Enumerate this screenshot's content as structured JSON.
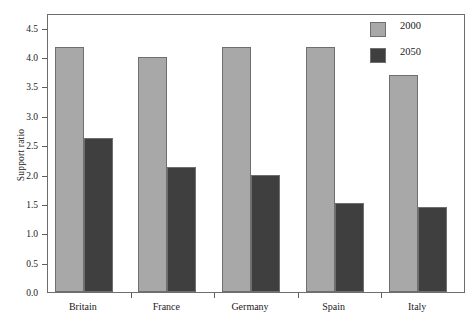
{
  "chart_data": {
    "type": "bar",
    "title": "",
    "subtitle": "",
    "xlabel": "",
    "ylabel": "Support ratio",
    "categories": [
      "Britain",
      "France",
      "Germany",
      "Spain",
      "Italy"
    ],
    "series": [
      {
        "name": "2000",
        "color": "#a8a8a8",
        "values": [
          4.17,
          4.0,
          4.17,
          4.17,
          3.69
        ]
      },
      {
        "name": "2050",
        "color": "#3f3f3f",
        "values": [
          2.63,
          2.13,
          2.0,
          1.52,
          1.44
        ]
      }
    ],
    "ylim": [
      0.0,
      4.75
    ],
    "yticks": [
      0.0,
      0.5,
      1.0,
      1.5,
      2.0,
      2.5,
      3.0,
      3.5,
      4.0,
      4.5
    ],
    "ytick_labels": [
      "0.0",
      "0.5",
      "1.0",
      "1.5",
      "2.0",
      "2.5",
      "3.0",
      "3.5",
      "4.0",
      "4.5"
    ],
    "grid": false,
    "legend_position": "top-right",
    "legend_entries": [
      "2000",
      "2050"
    ],
    "frame_color": "#6d6d6d",
    "background": "#ffffff"
  },
  "legend": {
    "items": [
      {
        "label": "2000"
      },
      {
        "label": "2050"
      }
    ]
  },
  "axis": {
    "y_title": "Support ratio"
  }
}
